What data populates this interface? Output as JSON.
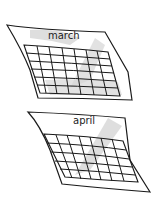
{
  "illustration": {
    "calendars": [
      {
        "month": "march",
        "rows": 6,
        "cols": 7
      },
      {
        "month": "april",
        "rows": 5,
        "cols": 7
      }
    ],
    "colors": {
      "ink": "#1a1a1a",
      "shade": "#cfcfcf",
      "paper": "#ffffff"
    }
  }
}
